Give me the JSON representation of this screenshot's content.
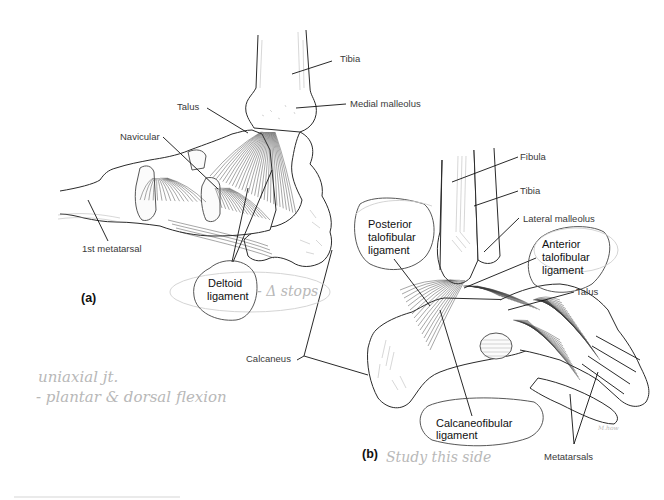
{
  "figure": {
    "panel_a": {
      "panel_label": "(a)",
      "view": "medial view of right ankle",
      "labels": {
        "tibia": "Tibia",
        "medial_malleolus": "Medial malleolus",
        "talus": "Talus",
        "navicular": "Navicular",
        "first_metatarsal": "1st metatarsal",
        "deltoid_line1": "Deltoid",
        "deltoid_line2": "ligament",
        "calcaneus": "Calcaneus"
      }
    },
    "panel_b": {
      "panel_label": "(b)",
      "view": "lateral view of right ankle",
      "labels": {
        "fibula": "Fibula",
        "tibia": "Tibia",
        "lateral_malleolus": "Lateral malleolus",
        "posterior_line1": "Posterior",
        "posterior_line2": "talofibular",
        "posterior_line3": "ligament",
        "anterior_line1": "Anterior",
        "anterior_line2": "talofibular",
        "anterior_line3": "ligament",
        "talus": "Talus",
        "calcaneofibular_line1": "Calcaneofibular",
        "calcaneofibular_line2": "ligament",
        "metatarsals": "Metatarsals"
      },
      "artist_signature": "M.how"
    },
    "handwritten_notes": {
      "note_deltoid": "- Δ stops",
      "note_line1": "uniaxial jt.",
      "note_line2": "- plantar & dorsal flexion",
      "note_b": "Study this side"
    },
    "colors": {
      "ink": "#111111",
      "label_text": "#3a3a3a",
      "pencil": "#b8b8b8",
      "background": "#ffffff"
    }
  }
}
